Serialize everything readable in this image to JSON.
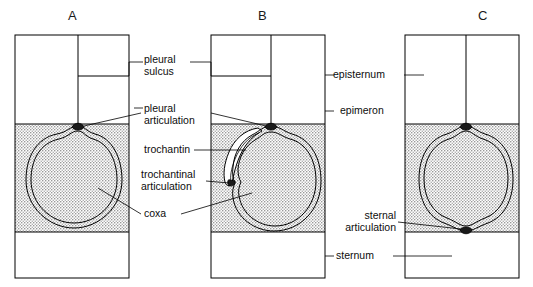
{
  "figure": {
    "kind": "anatomical-diagram",
    "background_color": "#ffffff",
    "line_color": "#000000",
    "stipple_fill_color": "#d9d9d9",
    "panels": [
      {
        "letter": "A",
        "name": "panel-a",
        "description": "monocondylic coxa with single pleural articulation"
      },
      {
        "letter": "B",
        "name": "panel-b",
        "description": "coxa with pleural articulation and trochantin with trochantinal articulation"
      },
      {
        "letter": "C",
        "name": "panel-c",
        "description": "dicondylic coxa with pleural and sternal articulations"
      }
    ],
    "labels": [
      {
        "id": "pleural-sulcus",
        "lines": [
          "pleural",
          "sulcus"
        ],
        "align": "left"
      },
      {
        "id": "pleural-articulation",
        "lines": [
          "pleural",
          "articulation"
        ],
        "align": "left"
      },
      {
        "id": "trochantin",
        "lines": [
          "trochantin"
        ],
        "align": "left"
      },
      {
        "id": "trochantinal-articulation",
        "lines": [
          "trochantinal",
          "articulation"
        ],
        "align": "left"
      },
      {
        "id": "coxa",
        "lines": [
          "coxa"
        ],
        "align": "left"
      },
      {
        "id": "episternum",
        "lines": [
          "episternum"
        ],
        "align": "left"
      },
      {
        "id": "epimeron",
        "lines": [
          "epimeron"
        ],
        "align": "left"
      },
      {
        "id": "sternal-articulation",
        "lines": [
          "sternal",
          "articulation"
        ],
        "align": "right"
      },
      {
        "id": "sternum",
        "lines": [
          "sternum"
        ],
        "align": "left"
      }
    ]
  }
}
